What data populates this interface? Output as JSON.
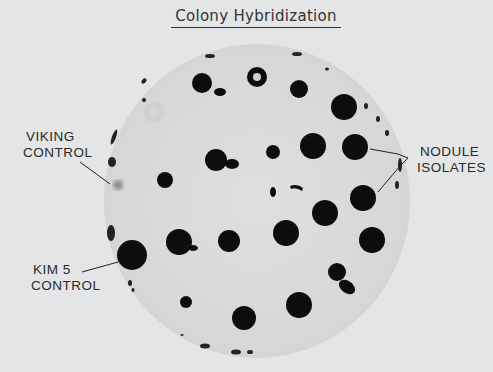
{
  "figure": {
    "title": "Colony Hybridization",
    "background_color": "#e4e5e6",
    "plate_color": "#d9dadb",
    "colony_color": "#111111"
  },
  "labels": {
    "viking_control": {
      "line1": "VIKING",
      "line2": "CONTROL"
    },
    "kim5_control": {
      "line1": "KIM 5",
      "line2": "CONTROL"
    },
    "nodule_isolates": {
      "line1": "NODULE",
      "line2": "ISOLATES"
    }
  },
  "plate": {
    "cx": 257,
    "cy": 201,
    "rx": 153,
    "ry": 157
  }
}
